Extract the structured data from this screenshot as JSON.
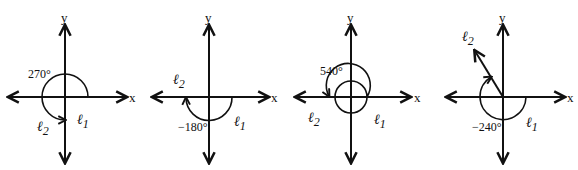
{
  "figure": {
    "axis_labels": {
      "x": "x",
      "y": "y"
    },
    "panels": [
      {
        "id": 1,
        "angle_label": "270°",
        "angle_deg": 270,
        "direction": "counterclockwise",
        "initial_ray": "ℓ",
        "initial_sub": "1",
        "terminal_ray": "ℓ",
        "terminal_sub": "2",
        "terminal_position": "negative y-axis"
      },
      {
        "id": 2,
        "angle_label": "−180°",
        "angle_deg": -180,
        "direction": "clockwise",
        "initial_ray": "ℓ",
        "initial_sub": "1",
        "terminal_ray": "ℓ",
        "terminal_sub": "2",
        "terminal_position": "negative x-axis"
      },
      {
        "id": 3,
        "angle_label": "540°",
        "angle_deg": 540,
        "direction": "counterclockwise",
        "initial_ray": "ℓ",
        "initial_sub": "1",
        "terminal_ray": "ℓ",
        "terminal_sub": "2",
        "terminal_position": "negative x-axis"
      },
      {
        "id": 4,
        "angle_label": "−240°",
        "angle_deg": -240,
        "direction": "clockwise",
        "initial_ray": "ℓ",
        "initial_sub": "1",
        "terminal_ray": "ℓ",
        "terminal_sub": "2",
        "terminal_position": "second quadrant at 120°"
      }
    ]
  }
}
